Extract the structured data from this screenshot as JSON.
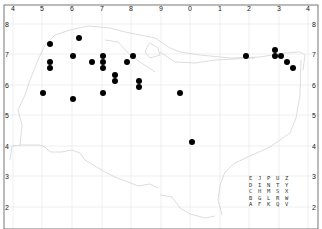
{
  "map": {
    "x_ticks": [
      {
        "label": "4",
        "x": 13
      },
      {
        "label": "5",
        "x": 42
      },
      {
        "label": "6",
        "x": 72
      },
      {
        "label": "7",
        "x": 102
      },
      {
        "label": "8",
        "x": 131
      },
      {
        "label": "9",
        "x": 161
      },
      {
        "label": "0",
        "x": 190
      },
      {
        "label": "1",
        "x": 220
      },
      {
        "label": "2",
        "x": 249
      },
      {
        "label": "3",
        "x": 279
      },
      {
        "label": "4",
        "x": 308
      }
    ],
    "y_ticks_left": [
      {
        "label": "8",
        "y": 24
      },
      {
        "label": "7",
        "y": 54
      },
      {
        "label": "6",
        "y": 85
      },
      {
        "label": "5",
        "y": 115
      },
      {
        "label": "4",
        "y": 146
      },
      {
        "label": "3",
        "y": 176
      },
      {
        "label": "2",
        "y": 207
      }
    ],
    "y_ticks_right": [
      {
        "label": "8",
        "y": 24
      },
      {
        "label": "7",
        "y": 54
      },
      {
        "label": "6",
        "y": 85
      },
      {
        "label": "5",
        "y": 115
      },
      {
        "label": "4",
        "y": 146
      },
      {
        "label": "3",
        "y": 176
      },
      {
        "label": "2",
        "y": 207
      }
    ],
    "points": [
      {
        "x": 50,
        "y": 44
      },
      {
        "x": 79,
        "y": 38
      },
      {
        "x": 50,
        "y": 62
      },
      {
        "x": 50,
        "y": 68
      },
      {
        "x": 43,
        "y": 93
      },
      {
        "x": 73,
        "y": 99
      },
      {
        "x": 73,
        "y": 56
      },
      {
        "x": 92,
        "y": 62
      },
      {
        "x": 103,
        "y": 56
      },
      {
        "x": 103,
        "y": 62
      },
      {
        "x": 103,
        "y": 68
      },
      {
        "x": 103,
        "y": 93
      },
      {
        "x": 115,
        "y": 75
      },
      {
        "x": 115,
        "y": 81
      },
      {
        "x": 127,
        "y": 62
      },
      {
        "x": 133,
        "y": 56
      },
      {
        "x": 139,
        "y": 81
      },
      {
        "x": 139,
        "y": 87
      },
      {
        "x": 180,
        "y": 93
      },
      {
        "x": 192,
        "y": 142
      },
      {
        "x": 246,
        "y": 56
      },
      {
        "x": 275,
        "y": 50
      },
      {
        "x": 275,
        "y": 56
      },
      {
        "x": 281,
        "y": 56
      },
      {
        "x": 287,
        "y": 62
      },
      {
        "x": 293,
        "y": 68
      }
    ],
    "legend_rows": [
      "E J P U Z",
      "D I N T Y",
      "C H M S X",
      "B G L R W",
      "A F K Q V"
    ],
    "colors": {
      "point": "#000000",
      "grid": "#e4e4e4",
      "coastline": "#cfcfcf",
      "frame": "#555555"
    }
  }
}
